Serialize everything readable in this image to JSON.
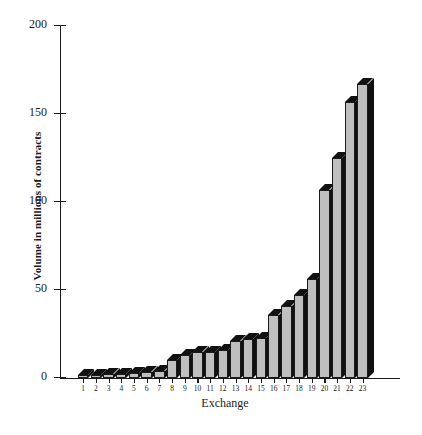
{
  "chart_data": {
    "type": "bar",
    "title": "",
    "subtitle": "",
    "xlabel": "Exchange",
    "ylabel": "Volume in millions of contracts",
    "categories": [
      "1",
      "2",
      "3",
      "4",
      "5",
      "6",
      "7",
      "8",
      "9",
      "10",
      "11",
      "12",
      "13",
      "14",
      "15",
      "16",
      "17",
      "18",
      "19",
      "20",
      "21",
      "22",
      "23"
    ],
    "values": [
      1.5,
      1.5,
      2,
      2.5,
      3,
      3.5,
      4,
      10,
      13,
      15,
      15,
      16,
      21,
      22,
      23,
      36,
      41,
      47,
      56,
      107,
      125,
      157,
      167
    ],
    "series": [
      {
        "name": "Volume",
        "values": [
          1.5,
          1.5,
          2,
          2.5,
          3,
          3.5,
          4,
          10,
          13,
          15,
          15,
          16,
          21,
          22,
          23,
          36,
          41,
          47,
          56,
          107,
          125,
          157,
          167
        ]
      }
    ],
    "ylim": [
      0,
      200
    ],
    "yticks": [
      0,
      50,
      100,
      150,
      200
    ],
    "ytick_labels": [
      "0",
      "50",
      "100",
      "150",
      "200"
    ],
    "xtick_labels": [
      "1",
      "2",
      "3",
      "4",
      "5",
      "6",
      "7",
      "8",
      "9",
      "10",
      "11",
      "12",
      "13",
      "14",
      "15",
      "16",
      "17",
      "18",
      "19",
      "20",
      "21",
      "22",
      "23"
    ],
    "grid": false,
    "legend": false,
    "legend_position": "none",
    "style": "3d-shaded-bars",
    "colors": {
      "bar_face": "#bfbfbf",
      "bar_shadow": "#111111",
      "axis": "#1a1a1a",
      "background": "#ffffff"
    }
  }
}
